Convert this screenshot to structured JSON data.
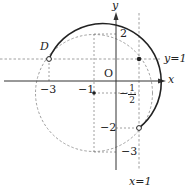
{
  "diagram": {
    "axes": {
      "x_label": "x",
      "y_label": "y",
      "origin_label": "O"
    },
    "lines": {
      "horizontal": "y=1",
      "vertical": "x=1"
    },
    "ticks": {
      "x": [
        "−3",
        "−1"
      ],
      "y": [
        "2",
        "−2",
        "−3"
      ],
      "half": {
        "sign": "−",
        "num": "1",
        "den": "2"
      }
    },
    "points": {
      "D": "D"
    },
    "circle": {
      "center": [
        -1,
        -0.5
      ],
      "note": "solid arc from D through top to (1,-2)"
    },
    "colors": {
      "stroke": "#222222",
      "dashed": "#888888"
    }
  }
}
